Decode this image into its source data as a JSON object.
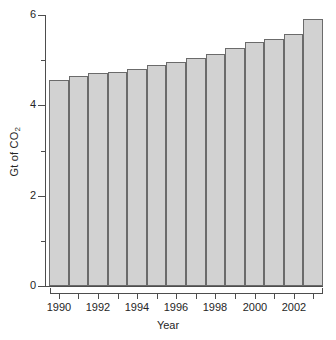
{
  "chart_data": {
    "type": "bar",
    "title": "",
    "xlabel": "Year",
    "ylabel": "Gt of CO2",
    "ylabel_parts": {
      "prefix": "Gt of CO",
      "subscript": "2"
    },
    "categories": [
      1990,
      1991,
      1992,
      1993,
      1994,
      1995,
      1996,
      1997,
      1998,
      1999,
      2000,
      2001,
      2002,
      2003
    ],
    "values": [
      4.56,
      4.64,
      4.71,
      4.73,
      4.8,
      4.89,
      4.96,
      5.04,
      5.13,
      5.27,
      5.4,
      5.47,
      5.58,
      5.91
    ],
    "ylim": [
      0,
      6
    ],
    "xlim": [
      1989.5,
      2003.5
    ],
    "y_major_ticks": [
      0,
      2,
      4,
      6
    ],
    "y_major_tick_labels": [
      "0",
      "2",
      "4",
      "6"
    ],
    "y_minor_ticks": [
      1,
      3,
      5
    ],
    "x_tick_labels": [
      "1990",
      "1992",
      "1994",
      "1996",
      "1998",
      "2000",
      "2002"
    ],
    "x_tick_values": [
      1990,
      1992,
      1994,
      1996,
      1998,
      2000,
      2002
    ],
    "grid": false,
    "legend": false,
    "bar_fill_color": "#d2d2d2",
    "bar_edge_color": "#6b6b6b",
    "axis_color": "#4d4d4d",
    "text_color": "#262626",
    "background_color": "#ffffff"
  }
}
